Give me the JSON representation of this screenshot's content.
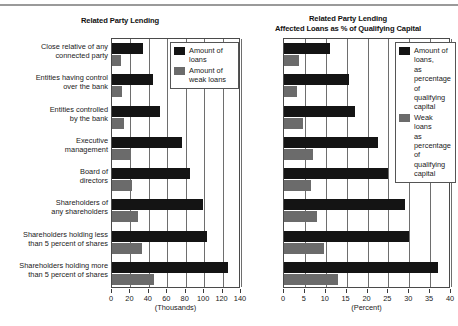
{
  "figure": {
    "top_rule": true
  },
  "left_chart": {
    "title": "Related Party Lending",
    "x_units": "(Thousands)",
    "legend": [
      {
        "label": "Amount of loans",
        "color": "#141414"
      },
      {
        "label": "Amount of weak loans",
        "color": "#6b6b6b"
      }
    ],
    "tick_labels": [
      "0",
      "20",
      "40",
      "60",
      "80",
      "100",
      "120",
      "140"
    ],
    "categories": [
      "Close relative of any\nconnected party",
      "Entities having control\nover the bank",
      "Entities controlled\nby the bank",
      "Executive\nmanagement",
      "Board of\ndirectors",
      "Shareholders of\nany shareholders",
      "Shareholders holding less\nthan 5 percent of shares",
      "Shareholders holding more\nthan 5 percent of shares"
    ]
  },
  "right_chart": {
    "title_line1": "Related Party Lending",
    "title_line2": "Affected  Loans as % of Qualifying Capital",
    "x_units": "(Percent)",
    "legend": [
      {
        "label": "Amount of loans,\nas percentage of\nqualifying capital",
        "color": "#141414"
      },
      {
        "label": "Weak loans\nas percentage of\nqualifying capital",
        "color": "#6b6b6b"
      }
    ],
    "tick_labels": [
      "0",
      "5",
      "10",
      "15",
      "20",
      "25",
      "30",
      "35",
      "40"
    ]
  },
  "chart_data": [
    {
      "type": "bar",
      "orientation": "horizontal",
      "title": "Related Party Lending",
      "xlabel": "(Thousands)",
      "ylabel": "",
      "xlim": [
        0,
        140
      ],
      "xticks": [
        0,
        20,
        40,
        60,
        80,
        100,
        120,
        140
      ],
      "grid": true,
      "grid_axis": "x",
      "legend_position": "top-right-inside",
      "categories": [
        "Close relative of any connected party",
        "Entities having control over the bank",
        "Entities controlled by the bank",
        "Executive management",
        "Board of directors",
        "Shareholders of any shareholders",
        "Shareholders holding less than 5 percent of shares",
        "Shareholders holding more than 5 percent of shares"
      ],
      "series": [
        {
          "name": "Amount of loans",
          "color": "#141414",
          "values": [
            34,
            45,
            52,
            76,
            85,
            99,
            103,
            126
          ]
        },
        {
          "name": "Amount of weak loans",
          "color": "#6b6b6b",
          "values": [
            10,
            11,
            13,
            20,
            22,
            28,
            33,
            46
          ]
        }
      ]
    },
    {
      "type": "bar",
      "orientation": "horizontal",
      "title": "Related Party Lending Affected  Loans as % of Qualifying Capital",
      "xlabel": "(Percent)",
      "ylabel": "",
      "xlim": [
        0,
        40
      ],
      "xticks": [
        0,
        5,
        10,
        15,
        20,
        25,
        30,
        35,
        40
      ],
      "grid": true,
      "grid_axis": "x",
      "legend_position": "top-right-inside",
      "categories": [
        "Close relative of any connected party",
        "Entities having control over the bank",
        "Entities controlled by the bank",
        "Executive management",
        "Board of directors",
        "Shareholders of any shareholders",
        "Shareholders holding less than 5 percent of shares",
        "Shareholders holding more than 5 percent of shares"
      ],
      "series": [
        {
          "name": "Amount of loans, as percentage of qualifying capital",
          "color": "#141414",
          "values": [
            11,
            15.5,
            17,
            22.5,
            25,
            29,
            30,
            37
          ]
        },
        {
          "name": "Weak loans as percentage of qualifying capital",
          "color": "#6b6b6b",
          "values": [
            3.5,
            3,
            4.5,
            7,
            6.5,
            8,
            9.5,
            13
          ]
        }
      ]
    }
  ]
}
